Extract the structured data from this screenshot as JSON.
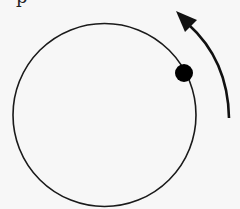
{
  "diagram": {
    "text_fragment": "p",
    "circle": {
      "cx": 104.5,
      "cy": 115,
      "r": 91.5,
      "stroke": "#1a1a1a"
    },
    "dot": {
      "cx": 184,
      "cy": 73,
      "r": 9,
      "fill": "#000000"
    },
    "arrow": {
      "direction": "counterclockwise",
      "start": [
        229,
        118
      ],
      "end": [
        180,
        14
      ],
      "color": "#111111"
    },
    "background": "#f7f7f7"
  }
}
